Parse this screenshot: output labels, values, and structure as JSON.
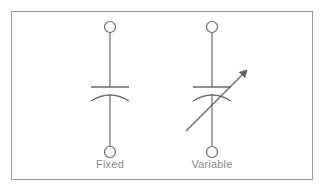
{
  "figure": {
    "background_color": "#ffffff",
    "border": {
      "color": "#9a9aa0",
      "x": 11,
      "y": 11,
      "width": 302,
      "height": 169,
      "stroke_width": 1
    },
    "stroke_color": "#6a6a72",
    "label_color": "#8c8c8c",
    "symbols": [
      {
        "id": "fixed",
        "label": "Fixed",
        "type": "fixed-capacitor",
        "center_x": 110,
        "terminal_top": {
          "cx": 110,
          "cy": 27,
          "r": 5.5
        },
        "terminal_bottom": {
          "cx": 110,
          "cy": 152,
          "r": 5.5
        },
        "lead_top": {
          "x": 110,
          "y1": 33,
          "y2": 87
        },
        "lead_bottom": {
          "x": 110,
          "y1": 96,
          "y2": 146
        },
        "plate_straight": {
          "y": 87,
          "x1": 91,
          "x2": 129
        },
        "plate_curved": {
          "x1": 91,
          "x2": 129,
          "y_edge": 101,
          "y_apex": 93
        },
        "label_x": 110,
        "label_y": 158
      },
      {
        "id": "variable",
        "label": "Variable",
        "type": "variable-capacitor",
        "center_x": 212,
        "terminal_top": {
          "cx": 212,
          "cy": 27,
          "r": 5.5
        },
        "terminal_bottom": {
          "cx": 212,
          "cy": 152,
          "r": 5.5
        },
        "lead_top": {
          "x": 212,
          "y1": 33,
          "y2": 87
        },
        "lead_bottom": {
          "x": 212,
          "y1": 96,
          "y2": 146
        },
        "plate_straight": {
          "y": 87,
          "x1": 193,
          "x2": 231
        },
        "plate_curved": {
          "x1": 193,
          "x2": 231,
          "y_edge": 101,
          "y_apex": 93
        },
        "arrow": {
          "x1": 186,
          "y1": 131,
          "x2": 247,
          "y2": 70,
          "head_size": 7
        },
        "label_x": 212,
        "label_y": 158
      }
    ]
  }
}
